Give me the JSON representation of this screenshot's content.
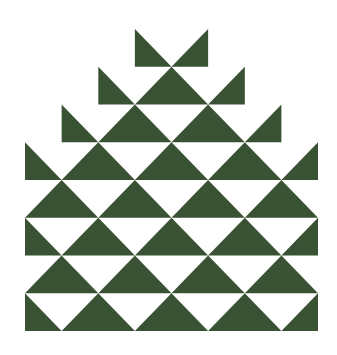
{
  "artwork": {
    "type": "geometric-triangle-pattern",
    "shape": "stepped-pyramid",
    "fill_color": "#3a5234",
    "background_color": "#ffffff",
    "rows": 8,
    "columns_full_width": 4,
    "bounds": {
      "left": 25,
      "right": 318,
      "top": 29,
      "bottom": 331
    }
  }
}
